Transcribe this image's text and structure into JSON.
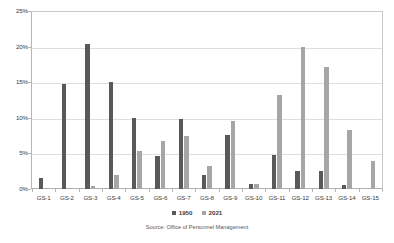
{
  "chart_data": {
    "type": "bar",
    "title": "",
    "xlabel": "",
    "ylabel": "",
    "ylim": [
      0,
      25
    ],
    "ytick_labels": [
      "0%",
      "5%",
      "10%",
      "15%",
      "20%",
      "25%"
    ],
    "ytick_values": [
      0,
      5,
      10,
      15,
      20,
      25
    ],
    "grid": true,
    "legend_position": "bottom-center",
    "categories": [
      "GS-1",
      "GS-2",
      "GS-3",
      "GS-4",
      "GS-5",
      "GS-6",
      "GS-7",
      "GS-8",
      "GS-9",
      "GS-10",
      "GS-11",
      "GS-12",
      "GS-13",
      "GS-14",
      "GS-15"
    ],
    "series": [
      {
        "name": "1950",
        "color": "#595959",
        "values": [
          1.5,
          14.8,
          20.4,
          15.0,
          10.0,
          4.7,
          9.9,
          2.0,
          7.6,
          0.7,
          4.8,
          2.6,
          2.6,
          0.6,
          0.0
        ]
      },
      {
        "name": "2021",
        "color": "#a6a6a6",
        "values": [
          0.0,
          0.1,
          0.4,
          2.0,
          5.3,
          6.7,
          7.5,
          3.2,
          9.6,
          0.7,
          13.2,
          20.0,
          17.2,
          8.3,
          4.0
        ]
      }
    ],
    "source": "Source:  Office of Personnel Management"
  }
}
